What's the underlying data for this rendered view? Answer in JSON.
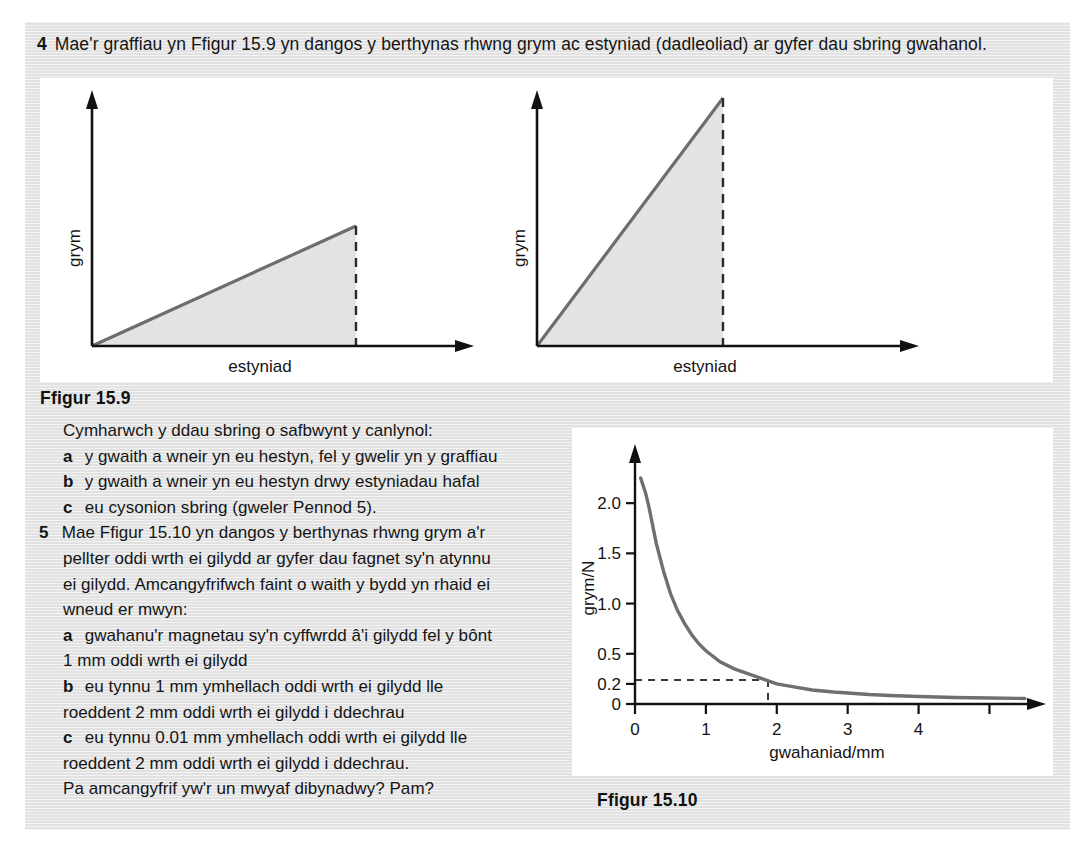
{
  "exercise": {
    "question4": {
      "number": "4",
      "text": "Mae'r graffiau yn Ffigur 15.9 yn dangos y berthynas rhwng grym ac estyniad (dadleoliad) ar gyfer dau sbring gwahanol."
    },
    "figure_159_caption": "Ffigur 15.9",
    "figure_1510_caption": "Ffigur 15.10",
    "prose_lines": [
      {
        "marker": "",
        "text": "Cymharwch y ddau sbring o safbwynt y canlynol:"
      },
      {
        "marker": "a",
        "text": "y gwaith a wneir yn eu hestyn, fel y gwelir yn y graffiau"
      },
      {
        "marker": "b",
        "text": "y gwaith a wneir yn eu hestyn drwy estyniadau hafal"
      },
      {
        "marker": "c",
        "text": "eu cysonion sbring (gweler Pennod 5)."
      },
      {
        "marker": "5",
        "text": "Mae Ffigur 15.10 yn dangos y berthynas rhwng grym a'r"
      },
      {
        "marker": "",
        "text": "pellter oddi wrth ei gilydd ar gyfer dau fagnet sy'n atynnu"
      },
      {
        "marker": "",
        "text": "ei gilydd. Amcangyfrifwch faint o waith y bydd yn rhaid ei"
      },
      {
        "marker": "",
        "text": "wneud er mwyn:"
      },
      {
        "marker": "a",
        "text": "gwahanu'r magnetau sy'n cyffwrdd â'i gilydd fel y bônt"
      },
      {
        "marker": "",
        "text": "1 mm oddi wrth ei gilydd"
      },
      {
        "marker": "b",
        "text": "eu tynnu 1 mm ymhellach oddi wrth ei gilydd lle"
      },
      {
        "marker": "",
        "text": "roeddent 2 mm oddi wrth ei gilydd i ddechrau"
      },
      {
        "marker": "c",
        "text": "eu tynnu 0.01 mm ymhellach oddi wrth ei gilydd lle"
      },
      {
        "marker": "",
        "text": "roeddent 2 mm oddi wrth ei gilydd i ddechrau."
      },
      {
        "marker": "",
        "text": "Pa amcangyfrif yw'r un mwyaf dibynadwy? Pam?"
      }
    ]
  },
  "colors": {
    "panel_background": "#e4e4e4",
    "plot_background": "#ffffff",
    "axis": "#111111",
    "curve": "#6f6f6f",
    "shade_fill": "#e3e3e3",
    "text": "#141414"
  },
  "chart_data": [
    {
      "id": "figure-15-9-left",
      "type": "area",
      "title": "",
      "xlabel": "estyniad",
      "ylabel": "grym",
      "x": [
        0,
        1.55
      ],
      "values": [
        0,
        0.45
      ],
      "xlim": [
        0,
        2.3
      ],
      "ylim": [
        0,
        1.0
      ],
      "grid": false,
      "legend": "none",
      "annotations": [
        {
          "type": "dashed-vertical",
          "x": 1.55,
          "y_from": 0,
          "y_to": 0.45
        },
        {
          "type": "shaded-area",
          "label": "work done",
          "x_from": 0,
          "x_to": 1.55
        }
      ],
      "axis_ticks": {
        "x": [],
        "y": []
      },
      "description": "Straight line of shallow gradient from origin; shaded triangle below it terminated by a dashed vertical line."
    },
    {
      "id": "figure-15-9-right",
      "type": "area",
      "title": "",
      "xlabel": "estyniad",
      "ylabel": "grym",
      "x": [
        0,
        1.1
      ],
      "values": [
        0,
        1.0
      ],
      "xlim": [
        0,
        2.3
      ],
      "ylim": [
        0,
        1.0
      ],
      "grid": false,
      "legend": "none",
      "annotations": [
        {
          "type": "dashed-vertical",
          "x": 1.1,
          "y_from": 0,
          "y_to": 1.0
        },
        {
          "type": "shaded-area",
          "label": "work done",
          "x_from": 0,
          "x_to": 1.1
        }
      ],
      "axis_ticks": {
        "x": [],
        "y": []
      },
      "description": "Straight line of steep gradient from origin reaching the top of the grym axis; shaded triangle below it terminated by a dashed vertical line."
    },
    {
      "id": "figure-15-10",
      "type": "line",
      "title": "",
      "xlabel": "gwahaniad/mm",
      "ylabel": "grym/N",
      "xlim": [
        0,
        5.6
      ],
      "ylim": [
        0,
        2.35
      ],
      "grid": false,
      "legend": "none",
      "x_ticks": [
        0,
        1,
        2,
        3,
        4,
        5
      ],
      "x_tick_labels": [
        "0",
        "1",
        "2",
        "3",
        "4",
        ""
      ],
      "y_ticks": [
        0,
        0.2,
        0.5,
        1.0,
        1.5,
        2.0
      ],
      "y_tick_labels": [
        "0",
        "0.2",
        "0.5",
        "1.0",
        "1.5",
        "2.0"
      ],
      "x": [
        0.08,
        0.15,
        0.2,
        0.3,
        0.4,
        0.5,
        0.6,
        0.7,
        0.8,
        0.9,
        1.0,
        1.2,
        1.4,
        1.6,
        1.8,
        2.0,
        2.2,
        2.5,
        2.8,
        3.0,
        3.3,
        3.6,
        4.0,
        4.5,
        5.0,
        5.5
      ],
      "values": [
        2.25,
        2.1,
        1.95,
        1.6,
        1.33,
        1.1,
        0.93,
        0.8,
        0.69,
        0.6,
        0.53,
        0.42,
        0.35,
        0.3,
        0.25,
        0.2,
        0.175,
        0.14,
        0.12,
        0.11,
        0.095,
        0.085,
        0.075,
        0.065,
        0.06,
        0.055
      ],
      "annotations": [
        {
          "type": "dashed-horizontal",
          "y": 0.2,
          "x_from": 0,
          "x_to": 2.0,
          "label": "0.2"
        },
        {
          "type": "dashed-vertical",
          "x": 2.0,
          "y_from": 0,
          "y_to": 0.2
        }
      ],
      "description": "Force between two magnets falls steeply with separation, approaching zero asymptotically; dashed guide lines mark 0.2 N at 2 mm."
    }
  ]
}
